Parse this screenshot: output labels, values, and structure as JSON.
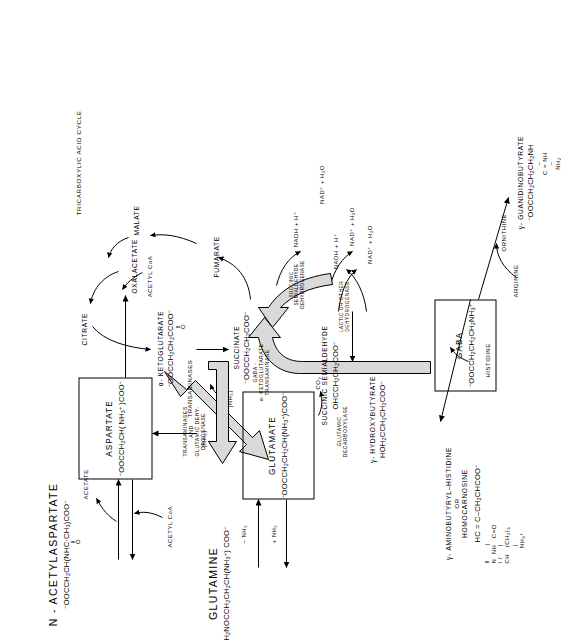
{
  "diagram": {
    "orientation_deg": -90,
    "accent_fill": "#d9d9d9",
    "line_color": "#000000"
  },
  "boxes": [
    {
      "id": "aspartate",
      "name": "ASPARTATE",
      "formula_html": "<sup>&minus;</sup>OOCCH<sub>2</sub>CH(&thinsp;NH<sub>3</sub><sup>+</sup>&thinsp;)COO<sup>&minus;</sup>"
    },
    {
      "id": "glutamate",
      "name": "GLUTAMATE",
      "formula_html": "<sup>&minus;</sup>OOCCH<sub>2</sub>CH<sub>2</sub>CH(NH<sub>3</sub><sup>+</sup>)COO<sup>&minus;</sup>"
    },
    {
      "id": "gaba",
      "name": "GABA",
      "formula_html": "<sup>&minus;</sup>OOCCH<sub>2</sub>CH<sub>2</sub>CH<sub>2</sub>NH<sub>3</sub><sup>+</sup>"
    }
  ],
  "metabolites": {
    "n_acetylaspartate": {
      "name": "N - ACETYLASPARTATE",
      "formula_html": "<sup>&minus;</sup>OOCCH<sub>2</sub>CH(NHC&middot;CH<sub>3</sub>)COO<sup>&minus;</sup>",
      "formula_note": "O"
    },
    "glutamine": {
      "name": "GLUTAMINE",
      "formula_html": "H<sub>2</sub>NOCCH<sub>2</sub>CH<sub>2</sub>CH(NH<sub>3</sub><sup>+</sup>) COO<sup>&minus;</sup>"
    },
    "alpha_ketoglutarate": {
      "name": "α- KETOGLUTARATE",
      "formula_html": "<sup>&minus;</sup>OOCCH<sub>2</sub>CH<sub>2</sub>CCOO<sup>&minus;</sup>",
      "formula_note": "O"
    },
    "succinate": {
      "name": "SUCCINATE",
      "formula_html": "<sup>&minus;</sup>OOCCH<sub>2</sub>CH<sub>2</sub>COO<sup>&minus;</sup>"
    },
    "succinic_semialdehyde": {
      "name": "SUCCINIC SEMIALDEHYDE",
      "formula_html": "OHCCH<sub>2</sub>CH<sub>2</sub>COO<sup>&minus;</sup>"
    },
    "gamma_hydroxybutyrate": {
      "name": "γ- HYDROXYBUTYRATE",
      "formula_html": "HOH<sub>2</sub>CCH<sub>2</sub>CH<sub>2</sub>COO<sup>&minus;</sup>"
    },
    "gamma_guanidinobutyrate": {
      "name": "γ- GUANIDINOBUTYRATE",
      "formula_html": "<sup>&minus;</sup>OOCCH<sub>2</sub>CH<sub>2</sub>CH<sub>2</sub>NH",
      "formula_line2": "C = NH",
      "formula_line3": "NH<sub>2</sub>"
    },
    "homocarnosine": {
      "name": "γ- AMINOBUTYRYL–HISTIDINE",
      "or": "OR",
      "alt_name": "HOMOCARNOSINE",
      "formula_html": "HC = C–CH<sub>2</sub>CHCOO<sup>&minus;</sup>"
    }
  },
  "cycle_nodes": [
    {
      "id": "oxalacetate",
      "label": "OXALACETATE"
    },
    {
      "id": "citrate",
      "label": "CITRATE"
    },
    {
      "id": "malate",
      "label": "MALATE"
    },
    {
      "id": "fumarate",
      "label": "FUMARATE"
    },
    {
      "id": "tca",
      "label": "TRICARBOXYLIC ACID CYCLE"
    }
  ],
  "cofactors": [
    {
      "id": "acetyl_coa_top",
      "label": "ACETYL CoA"
    },
    {
      "id": "acetate",
      "label": "ACETATE"
    },
    {
      "id": "acetyl_coa_cycle",
      "label": "ACETYL CoA"
    },
    {
      "id": "nh3_plus",
      "label": "+ NH₃"
    },
    {
      "id": "nh3_minus",
      "label": "– NH₃"
    },
    {
      "id": "nh3_brk_asp",
      "label": "[NH₃]"
    },
    {
      "id": "nh3_brk_glu",
      "label": "[NH₃]"
    },
    {
      "id": "co2",
      "label": "CO₂"
    },
    {
      "id": "nadh_h_top",
      "label": "NADH + H⁺"
    },
    {
      "id": "nad_h2o_top",
      "label": "NAD⁺ + H₂O"
    },
    {
      "id": "nadh_h_bot",
      "label": "NADH + H⁺"
    },
    {
      "id": "nad_h2o_bl",
      "label": "NAD⁺ + H₂O"
    },
    {
      "id": "nad_h2o_br",
      "label": "NAD⁺ + H₂O"
    },
    {
      "id": "histidine",
      "label": "HISTIDINE"
    },
    {
      "id": "arginine",
      "label": "ARGININE"
    },
    {
      "id": "ornithine",
      "label": "ORNITHINE"
    }
  ],
  "enzymes": [
    {
      "id": "transaminases_asp",
      "lines": [
        "TRANSAMINASES"
      ]
    },
    {
      "id": "transaminases_gdh",
      "lines": [
        "TRANSAMINASES",
        "AND",
        "GLUTAMIC DEHY-",
        "DROGENASE"
      ]
    },
    {
      "id": "gaba_akg_transaminase",
      "lines": [
        "GABA -",
        "α- KETOGLUTARATE",
        "TRANSAMINASE"
      ]
    },
    {
      "id": "glutamic_decarboxylase",
      "lines": [
        "GLUTAMIC",
        "DECARBOXYLASE"
      ]
    },
    {
      "id": "ssadh",
      "lines": [
        "SUCCINIC",
        "SEMIALDEHYDE",
        "DEHYDROGENASE"
      ]
    },
    {
      "id": "lactic_dehydrogenase",
      "lines": [
        "LACTIC OR OTHER",
        "DEHYDROGENASE"
      ]
    }
  ]
}
